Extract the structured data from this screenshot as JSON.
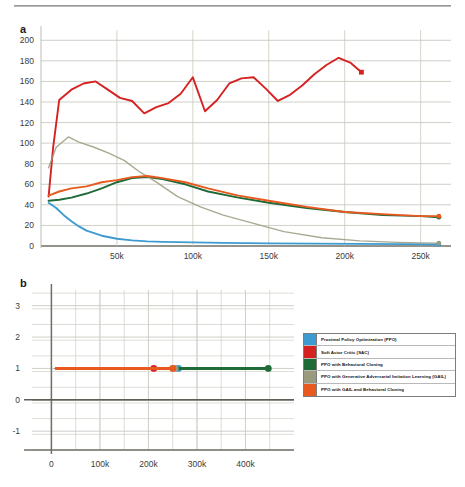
{
  "figure": {
    "panel_a_label": "a",
    "panel_b_label": "b",
    "caption": ""
  },
  "legend": {
    "position": "right-middle",
    "items": [
      {
        "label": "Proximal Policy Optimization (PPO)",
        "color": "#3d9bd1"
      },
      {
        "label": "Soft Actor Critic (SAC)",
        "color": "#d62121"
      },
      {
        "label": "PPO with Behavioral Cloning",
        "color": "#1f6b38"
      },
      {
        "label": "PPO with Generative Adversarial Imitation Learning (GAIL)",
        "color": "#9a9a7e"
      },
      {
        "label": "PPO with GAIL and Behavioral Cloning",
        "color": "#e8591f"
      }
    ]
  },
  "chart_data": [
    {
      "type": "line",
      "panel": "a",
      "title": "",
      "xlabel": "",
      "ylabel": "",
      "xlim": [
        0,
        270000
      ],
      "ylim": [
        0,
        210
      ],
      "grid": true,
      "xticks": [
        50000,
        100000,
        150000,
        200000,
        250000
      ],
      "xticklabels": [
        "50k",
        "100k",
        "150k",
        "200k",
        "250k"
      ],
      "yticks": [
        0,
        20,
        40,
        60,
        80,
        100,
        120,
        140,
        160,
        180,
        200
      ],
      "yticklabels": [
        "0",
        "20",
        "40",
        "60",
        "80",
        "100",
        "120",
        "140",
        "160",
        "180",
        "200"
      ],
      "series": [
        {
          "name": "Proximal Policy Optimization (PPO)",
          "color": "#3d9bd1",
          "endpoint_marker": true,
          "x": [
            5000,
            10000,
            15000,
            20000,
            25000,
            30000,
            40000,
            50000,
            60000,
            70000,
            80000,
            100000,
            120000,
            150000,
            180000,
            210000,
            240000,
            262000
          ],
          "y": [
            42,
            37,
            30,
            24,
            19,
            15,
            10,
            7,
            5.5,
            4.5,
            4,
            3.5,
            3,
            2.6,
            2.3,
            2.1,
            1.8,
            1.5
          ]
        },
        {
          "name": "Soft Actor Critic (SAC)",
          "color": "#d62121",
          "endpoint_marker": true,
          "x": [
            5000,
            8000,
            12000,
            20000,
            28000,
            36000,
            44000,
            52000,
            60000,
            68000,
            76000,
            84000,
            92000,
            100000,
            108000,
            116000,
            124000,
            132000,
            140000,
            148000,
            156000,
            164000,
            172000,
            180000,
            188000,
            196000,
            204000,
            211000
          ],
          "y": [
            48,
            96,
            142,
            152,
            158,
            160,
            152,
            144,
            141,
            129,
            135,
            139,
            148,
            164,
            131,
            142,
            158,
            163,
            164,
            153,
            141,
            147,
            156,
            167,
            176,
            183,
            178,
            169
          ]
        },
        {
          "name": "PPO with Behavioral Cloning",
          "color": "#1f6b38",
          "endpoint_marker": true,
          "x": [
            5000,
            12000,
            20000,
            30000,
            40000,
            50000,
            60000,
            70000,
            80000,
            95000,
            110000,
            130000,
            150000,
            175000,
            200000,
            225000,
            250000,
            262000
          ],
          "y": [
            44,
            45,
            47,
            51,
            56,
            62,
            66,
            67,
            65,
            60,
            53,
            47,
            42,
            37,
            33,
            30,
            29,
            28
          ]
        },
        {
          "name": "PPO with Generative Adversarial Imitation Learning (GAIL)",
          "color": "#9a9a7e",
          "endpoint_marker": true,
          "x": [
            5000,
            10000,
            18000,
            25000,
            35000,
            45000,
            55000,
            65000,
            75000,
            90000,
            105000,
            120000,
            140000,
            160000,
            185000,
            210000,
            235000,
            250000,
            262000
          ],
          "y": [
            76,
            96,
            106,
            101,
            96,
            90,
            83,
            72,
            63,
            48,
            38,
            30,
            22,
            14,
            8,
            5,
            3.5,
            3,
            2.8
          ]
        },
        {
          "name": "PPO with GAIL and Behavioral Cloning",
          "color": "#e8591f",
          "endpoint_marker": true,
          "x": [
            5000,
            12000,
            20000,
            30000,
            40000,
            50000,
            60000,
            70000,
            80000,
            95000,
            110000,
            130000,
            150000,
            175000,
            200000,
            225000,
            250000,
            262000
          ],
          "y": [
            49,
            53,
            56,
            58,
            62,
            64,
            67,
            68,
            66,
            62,
            56,
            49,
            44,
            38,
            33,
            31,
            29,
            29
          ]
        }
      ]
    },
    {
      "type": "line",
      "panel": "b",
      "title": "",
      "xlabel": "",
      "ylabel": "",
      "xlim": [
        -40000,
        500000
      ],
      "ylim": [
        -1.6,
        3.5
      ],
      "grid": true,
      "xticks": [
        0,
        100000,
        200000,
        300000,
        400000
      ],
      "xticklabels": [
        "0",
        "100k",
        "200k",
        "300k",
        "400k"
      ],
      "yticks": [
        -1,
        0,
        1,
        2,
        3
      ],
      "yticklabels": [
        "-1",
        "0",
        "1",
        "2",
        "3"
      ],
      "series": [
        {
          "name": "Proximal Policy Optimization (PPO)",
          "color": "#3d9bd1",
          "endpoint_marker": true,
          "x": [
            10000,
            262000
          ],
          "y": [
            1.0,
            1.0
          ]
        },
        {
          "name": "Soft Actor Critic (SAC)",
          "color": "#d62121",
          "endpoint_marker": true,
          "x": [
            10000,
            211000
          ],
          "y": [
            1.0,
            1.0
          ]
        },
        {
          "name": "PPO with Behavioral Cloning",
          "color": "#1f6b38",
          "endpoint_marker": true,
          "x": [
            10000,
            447000
          ],
          "y": [
            1.0,
            1.0
          ]
        },
        {
          "name": "PPO with Generative Adversarial Imitation Learning (GAIL)",
          "color": "#9a9a7e",
          "endpoint_marker": true,
          "x": [
            10000,
            255000
          ],
          "y": [
            1.0,
            1.0
          ]
        },
        {
          "name": "PPO with GAIL and Behavioral Cloning",
          "color": "#e8591f",
          "endpoint_marker": true,
          "x": [
            10000,
            250000
          ],
          "y": [
            1.0,
            1.0
          ]
        }
      ]
    }
  ]
}
